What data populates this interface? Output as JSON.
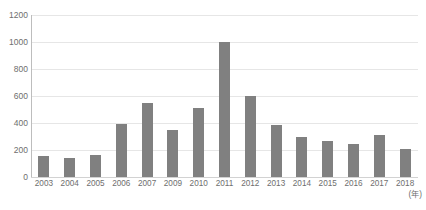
{
  "title_sliver": {
    "left_fragment": "",
    "right_fragment": ""
  },
  "colors": {
    "bar": "#808080",
    "gridline": "#e6e6e6",
    "axis": "#bdbdbd",
    "text": "#6e6e6e",
    "background": "#ffffff"
  },
  "axis": {
    "y_unit": "",
    "x_unit": "(年)"
  },
  "chart_data": {
    "type": "bar",
    "title": "",
    "xlabel": "(年)",
    "ylabel": "",
    "ylim": [
      0,
      1200
    ],
    "yticks": [
      0,
      200,
      400,
      600,
      800,
      1000,
      1200
    ],
    "ytick_labels": [
      "0",
      "200",
      "400",
      "600",
      "800",
      "1000",
      "1200"
    ],
    "grid": true,
    "legend": "none",
    "categories": [
      "2003",
      "2004",
      "2005",
      "2006",
      "2007",
      "2009",
      "2010",
      "2011",
      "2012",
      "2013",
      "2014",
      "2015",
      "2016",
      "2017",
      "2018"
    ],
    "values": [
      155,
      140,
      160,
      390,
      545,
      345,
      510,
      1000,
      600,
      385,
      300,
      265,
      245,
      310,
      210
    ]
  }
}
